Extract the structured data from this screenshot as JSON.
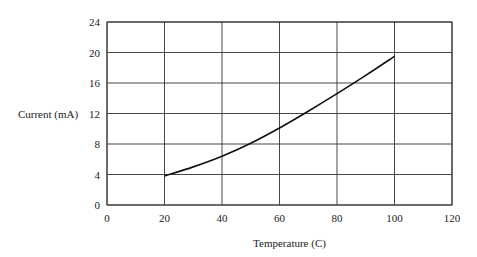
{
  "chart_data": {
    "type": "line",
    "title": "",
    "xlabel": "Temperature (C)",
    "ylabel": "Current (mA)",
    "xlim": [
      0,
      120
    ],
    "ylim": [
      0,
      24
    ],
    "xticks": [
      0,
      20,
      40,
      60,
      80,
      100,
      120
    ],
    "yticks": [
      0,
      4,
      8,
      12,
      16,
      20,
      24
    ],
    "xtick_labels": [
      "0",
      "20",
      "40",
      "60",
      "80",
      "100",
      "120"
    ],
    "ytick_labels": [
      "0",
      "4",
      "8",
      "12",
      "16",
      "20",
      "24"
    ],
    "grid": true,
    "legend": null,
    "series": [
      {
        "name": "Current vs Temperature",
        "x": [
          20,
          30,
          40,
          50,
          60,
          70,
          80,
          90,
          100
        ],
        "y": [
          3.8,
          5.0,
          6.4,
          8.1,
          10.1,
          12.3,
          14.6,
          17.0,
          19.5
        ],
        "color": "#111111"
      }
    ]
  }
}
